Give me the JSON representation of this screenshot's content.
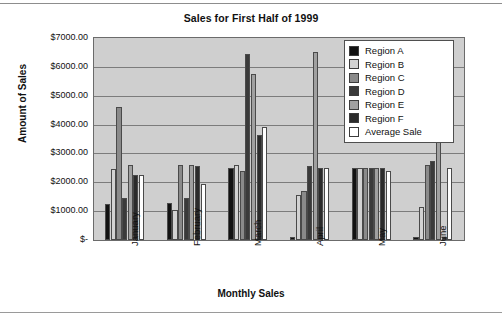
{
  "chart_data": {
    "type": "bar",
    "title": "Sales for First Half of 1999",
    "xlabel": "Monthly Sales",
    "ylabel": "Amount of Sales",
    "categories": [
      "January",
      "February",
      "March",
      "April",
      "May",
      "June"
    ],
    "ytick_labels": [
      "$7000.00",
      "$6000.00",
      "$5000.00",
      "$4000.00",
      "$3000.00",
      "$2000.00",
      "$1000.00",
      "$-"
    ],
    "ytick_values": [
      7000,
      6000,
      5000,
      4000,
      3000,
      2000,
      1000,
      0
    ],
    "ylim": [
      0,
      7000
    ],
    "grid": true,
    "legend_position": "top-right-inside",
    "series": [
      {
        "name": "Region A",
        "color": "#121212",
        "values": [
          1250,
          1300,
          2500,
          100,
          2500,
          100
        ]
      },
      {
        "name": "Region B",
        "color": "#d2d2d2",
        "values": [
          2450,
          1050,
          2600,
          1550,
          2500,
          1150
        ]
      },
      {
        "name": "Region C",
        "color": "#8a8a8a",
        "values": [
          4600,
          2600,
          2400,
          1700,
          2500,
          2600
        ]
      },
      {
        "name": "Region D",
        "color": "#3a3a3a",
        "values": [
          1450,
          1450,
          6450,
          2550,
          2500,
          2750
        ]
      },
      {
        "name": "Region E",
        "color": "#a0a0a0",
        "values": [
          2600,
          2600,
          5750,
          6500,
          2500,
          3500
        ]
      },
      {
        "name": "Region F",
        "color": "#2b2b2b",
        "values": [
          2250,
          2550,
          3650,
          2500,
          2500,
          100
        ]
      },
      {
        "name": "Average Sale",
        "color": "#ffffff",
        "values": [
          2250,
          1950,
          3900,
          2500,
          2400,
          2500
        ]
      }
    ]
  }
}
